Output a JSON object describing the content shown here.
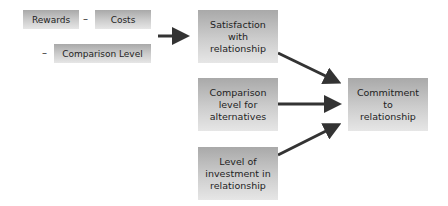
{
  "inputs": {
    "rewards": "Rewards",
    "minus1": "–",
    "costs": "Costs",
    "minus2": "–",
    "comparison_level": "Comparison Level"
  },
  "factors": [
    {
      "id": "satisfaction",
      "label": "Satisfaction with relationship",
      "lines": [
        "Satisfaction",
        "with",
        "relationship"
      ]
    },
    {
      "id": "alternatives",
      "label": "Comparison level for alternatives",
      "lines": [
        "Comparison",
        "level for",
        "alternatives"
      ]
    },
    {
      "id": "investment",
      "label": "Level of investment in relationship",
      "lines": [
        "Level of",
        "investment in",
        "relationship"
      ]
    }
  ],
  "outcome": {
    "label": "Commitment to relationship",
    "lines": [
      "Commitment",
      "to",
      "relationship"
    ]
  },
  "colors": {
    "arrow": "#333333",
    "box_top": "#a9a9a9",
    "box_bottom": "#e6e6e6"
  }
}
